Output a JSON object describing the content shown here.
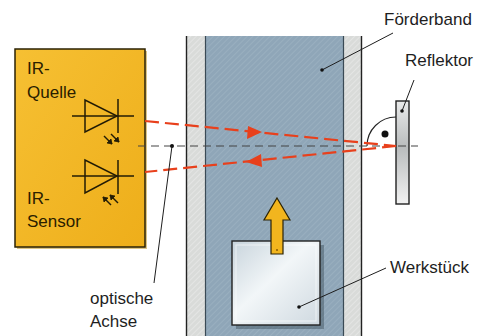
{
  "diagram": {
    "type": "reflex light barrier (Reflexionslichtschranke)",
    "labels": {
      "conveyor": "Förderband",
      "reflector": "Reflektor",
      "workpiece": "Werkstück",
      "optical_axis_line1": "optische",
      "optical_axis_line2": "Achse",
      "ir_source_line1": "IR-",
      "ir_source_line2": "Quelle",
      "ir_sensor_line1": "IR-",
      "ir_sensor_line2": "Sensor"
    },
    "components": [
      {
        "id": "sensor-housing",
        "label": "IR-Quelle / IR-Sensor",
        "color": "#f2b51e"
      },
      {
        "id": "conveyor-belt",
        "label": "Förderband",
        "color": "#8fa6b8"
      },
      {
        "id": "reflector",
        "label": "Reflektor",
        "color": "#d9dcdd"
      },
      {
        "id": "workpiece",
        "label": "Werkstück",
        "color": "#dfe7ec"
      },
      {
        "id": "movement-arrow",
        "direction": "up",
        "color": "#f2b51e"
      }
    ],
    "colors": {
      "housing": "#f2b51e",
      "belt": "#8fa6b8",
      "belt_edge": "#d8dad8",
      "beam": "#e8401c",
      "axis": "#444444",
      "outline": "#222222"
    }
  }
}
